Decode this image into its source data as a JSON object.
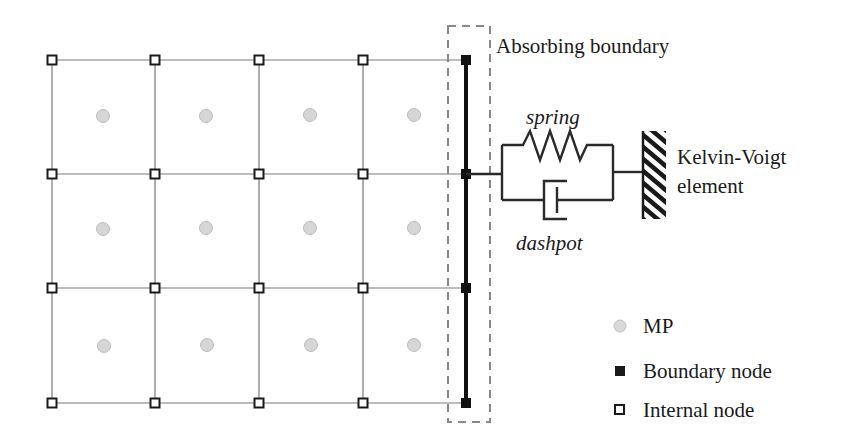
{
  "diagram": {
    "type": "mpm-absorbing-boundary-schematic",
    "grid": {
      "columns_x": [
        52,
        155,
        259,
        363
      ],
      "boundary_x": 466,
      "rows_y": [
        60,
        174,
        288,
        403
      ],
      "line_color": "#7a7a7a"
    },
    "material_points": {
      "color": "#d6d6d6",
      "stroke": "#bdbdbd",
      "centers": [
        [
          103,
          116
        ],
        [
          206,
          116
        ],
        [
          310,
          115
        ],
        [
          414,
          115
        ],
        [
          103,
          229
        ],
        [
          206,
          228
        ],
        [
          310,
          228
        ],
        [
          414,
          228
        ],
        [
          104,
          346
        ],
        [
          207,
          345
        ],
        [
          311,
          345
        ],
        [
          414,
          345
        ]
      ]
    },
    "boundary": {
      "label": "Absorbing boundary",
      "nodes_y": [
        60,
        174,
        288,
        403
      ],
      "line_color": "#111111",
      "dash_box": {
        "x": 448,
        "y": 26,
        "w": 42,
        "h": 396,
        "color": "#888888"
      }
    },
    "kelvin_voigt": {
      "label_line1": "Kelvin-Voigt",
      "label_line2": "element",
      "spring_label": "spring",
      "dashpot_label": "dashpot",
      "color": "#2a2a2a"
    },
    "legend": {
      "items": [
        {
          "symbol": "circle-gray",
          "label": "MP"
        },
        {
          "symbol": "square-filled",
          "label": "Boundary node"
        },
        {
          "symbol": "square-open",
          "label": "Internal node"
        }
      ]
    }
  }
}
